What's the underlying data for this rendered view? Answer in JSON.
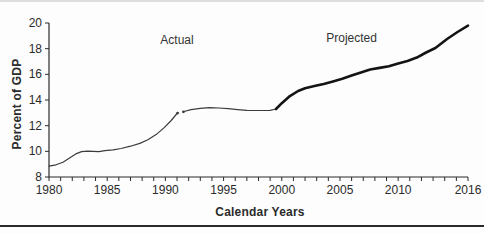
{
  "figure": {
    "background": "#fdfdfd",
    "top_rule_color": "#dedede",
    "bottom_rule_color": "#2a2a2a"
  },
  "chart_data": {
    "type": "line",
    "title": "",
    "xlabel": "Calendar Years",
    "ylabel": "Percent of GDP",
    "xlim": [
      1980,
      2016
    ],
    "ylim": [
      8,
      20
    ],
    "x_ticks_labeled": [
      1980,
      1985,
      1990,
      1995,
      2000,
      2005,
      2010,
      2016
    ],
    "x_minor_tick_step": 1,
    "y_ticks": [
      8,
      10,
      12,
      14,
      16,
      18,
      20
    ],
    "grid": false,
    "legend_position": "none",
    "axis_color": "#2b2b2b",
    "text_color": "#2b2b2b",
    "annotations": [
      {
        "text": "Actual",
        "x": 1991.0,
        "y": 18.7
      },
      {
        "text": "Projected",
        "x": 2006.0,
        "y": 18.8
      }
    ],
    "series": [
      {
        "name": "actual-segment-1",
        "label": "Actual",
        "style": "thin",
        "color": "#3c3c3c",
        "points": [
          [
            1980,
            8.85
          ],
          [
            1980.6,
            8.95
          ],
          [
            1981.2,
            9.15
          ],
          [
            1981.8,
            9.5
          ],
          [
            1982.3,
            9.8
          ],
          [
            1982.8,
            9.98
          ],
          [
            1983.3,
            10.02
          ],
          [
            1983.8,
            10.0
          ],
          [
            1984.3,
            9.97
          ],
          [
            1984.8,
            10.05
          ],
          [
            1985.5,
            10.12
          ],
          [
            1986.2,
            10.22
          ],
          [
            1987,
            10.4
          ],
          [
            1987.8,
            10.62
          ],
          [
            1988.5,
            10.9
          ],
          [
            1989.2,
            11.3
          ],
          [
            1989.9,
            11.85
          ],
          [
            1990.5,
            12.4
          ],
          [
            1991.0,
            12.95
          ]
        ]
      },
      {
        "name": "actual-segment-2",
        "label": "Actual",
        "style": "thin",
        "color": "#3c3c3c",
        "points": [
          [
            1991.6,
            13.1
          ],
          [
            1992.2,
            13.25
          ],
          [
            1993,
            13.35
          ],
          [
            1993.8,
            13.4
          ],
          [
            1994.6,
            13.38
          ],
          [
            1995.4,
            13.32
          ],
          [
            1996.2,
            13.25
          ],
          [
            1997,
            13.2
          ],
          [
            1998,
            13.18
          ],
          [
            1999,
            13.2
          ],
          [
            1999.5,
            13.3
          ]
        ]
      },
      {
        "name": "projected",
        "label": "Projected",
        "style": "thick",
        "color": "#141414",
        "points": [
          [
            1999.5,
            13.3
          ],
          [
            2000,
            13.75
          ],
          [
            2000.7,
            14.3
          ],
          [
            2001.4,
            14.7
          ],
          [
            2002,
            14.92
          ],
          [
            2002.8,
            15.08
          ],
          [
            2003.6,
            15.25
          ],
          [
            2004.4,
            15.45
          ],
          [
            2005.2,
            15.65
          ],
          [
            2006,
            15.9
          ],
          [
            2006.8,
            16.15
          ],
          [
            2007.6,
            16.38
          ],
          [
            2008.4,
            16.5
          ],
          [
            2009.2,
            16.63
          ],
          [
            2010,
            16.85
          ],
          [
            2010.8,
            17.05
          ],
          [
            2011.6,
            17.3
          ],
          [
            2012.4,
            17.7
          ],
          [
            2013.2,
            18.05
          ],
          [
            2014.2,
            18.75
          ],
          [
            2015.1,
            19.3
          ],
          [
            2016,
            19.8
          ]
        ]
      }
    ],
    "break_markers": [
      [
        1991.05,
        12.98
      ],
      [
        1991.55,
        13.08
      ]
    ]
  }
}
